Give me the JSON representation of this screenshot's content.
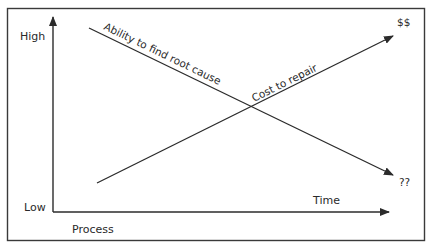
{
  "diagram": {
    "y_axis": {
      "high_label": "High",
      "low_label": "Low"
    },
    "x_axis": {
      "start_label": "Process",
      "end_label": "Time"
    },
    "lines": [
      {
        "name": "ability",
        "label": "Ability to find root cause",
        "end_marker": "??",
        "direction": "decreasing"
      },
      {
        "name": "cost",
        "label": "Cost to repair",
        "end_marker": "$$",
        "direction": "increasing"
      }
    ],
    "colors": {
      "line": "#2b2b2b",
      "frame": "#3a3a3a",
      "text": "#2a2a2a",
      "background": "#ffffff"
    }
  }
}
